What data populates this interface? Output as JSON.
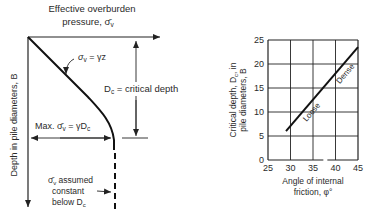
{
  "left_diagram": {
    "top_label_line1": "Effective overburden",
    "top_label_line2": "pressure, σ̄",
    "top_label_sub": "v",
    "y_axis_label": "Depth in pile diameters, B",
    "linear_eq_sigma": "σ",
    "linear_eq_sub": "v",
    "linear_eq_rhs": " = γz",
    "critical_depth_D": "D",
    "critical_depth_sub": "c",
    "critical_depth_rest": " = critical depth",
    "max_prefix": "Max. σ̄",
    "max_sub": "v",
    "max_rhs": " = γD",
    "max_rhs_sub": "c",
    "note_line1_sigma": "σ̄",
    "note_line1_sub": "v",
    "note_line1_rest": " assumed",
    "note_line2": "constant",
    "note_line3": "below D",
    "note_line3_sub": "c"
  },
  "chart_data": {
    "type": "line",
    "title": "",
    "xlabel_line1": "Angle of internal",
    "xlabel_line2": "friction, φ°",
    "ylabel_line1": "Critical depth, D",
    "ylabel_sub": "c",
    "ylabel_line1_end": ", in",
    "ylabel_line2": "pile diameters, B",
    "xlim": [
      25,
      45
    ],
    "ylim": [
      0,
      25
    ],
    "x_ticks": [
      "25",
      "30",
      "35",
      "40",
      "45"
    ],
    "y_ticks": [
      "0",
      "5",
      "10",
      "15",
      "20",
      "25"
    ],
    "grid": true,
    "series": [
      {
        "name": "Critical depth",
        "x": [
          29,
          45
        ],
        "y": [
          6,
          23.5
        ]
      }
    ],
    "annotations": [
      "Loose",
      "Dense"
    ]
  }
}
